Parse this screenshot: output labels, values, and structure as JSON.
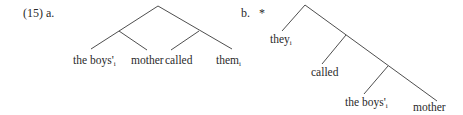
{
  "example": {
    "number": "(15)",
    "a_label": "a.",
    "b_label": "b.",
    "b_judgment": "*"
  },
  "tree_a": {
    "leaves": [
      {
        "text": "the boys'",
        "index": "i"
      },
      {
        "text": "mother",
        "index": ""
      },
      {
        "text": "called",
        "index": ""
      },
      {
        "text": "them",
        "index": "i"
      }
    ],
    "structure": "[[the boys'_i mother] [called them_i]]"
  },
  "tree_b": {
    "leaves": [
      {
        "text": "they",
        "index": "i"
      },
      {
        "text": "called",
        "index": ""
      },
      {
        "text": "the boys'",
        "index": "i"
      },
      {
        "text": "mother",
        "index": ""
      }
    ],
    "structure": "[they_i [called [the boys'_i mother]]]"
  },
  "colors": {
    "line": "#3a3a3a",
    "text": "#2a2a2a"
  }
}
